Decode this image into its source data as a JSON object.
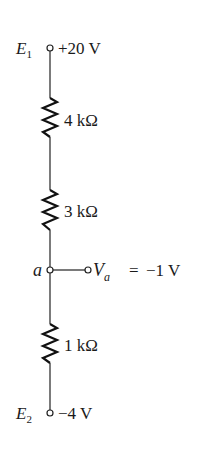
{
  "diagram": {
    "type": "voltage-divider-circuit",
    "sources": [
      {
        "name": "E",
        "subscript": "1",
        "value": "+20 V"
      },
      {
        "name": "E",
        "subscript": "2",
        "value": "−4 V"
      }
    ],
    "resistors": [
      {
        "label": "4 kΩ"
      },
      {
        "label": "3 kΩ"
      },
      {
        "label": "1 kΩ"
      }
    ],
    "node": {
      "name": "a",
      "output_symbol": "V",
      "output_subscript": "a",
      "equals": "=",
      "output_value": "−1 V"
    }
  }
}
